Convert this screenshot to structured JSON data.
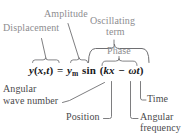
{
  "figure": {
    "kind": "annotated-equation-diagram",
    "colors": {
      "top_label": "#8d8d90",
      "bottom_label": "#4a4a4c",
      "equation": "#17171a",
      "leader_line": "#6f6f72",
      "brace": "#6f6f72",
      "background": "#ffffff"
    }
  },
  "equation": {
    "full_text": "y(x,t) = y_m sin (kx - ωt)",
    "lhs_function": "y",
    "lhs_open": "(",
    "lhs_var_x": "x",
    "lhs_comma": ",",
    "lhs_var_t": "t",
    "lhs_close": ")",
    "equals": "=",
    "amplitude_symbol": "y",
    "amplitude_subscript": "m",
    "sine": "sin",
    "phase_open": "(",
    "wave_number": "k",
    "position": "x",
    "minus": "−",
    "omega": "ω",
    "time": "t",
    "phase_close": ")"
  },
  "labels": {
    "top": [
      {
        "id": "displacement",
        "text": "Displacement"
      },
      {
        "id": "amplitude",
        "text": "Amplitude"
      },
      {
        "id": "oscillating-term-line1",
        "text": "Oscillating"
      },
      {
        "id": "oscillating-term-line2",
        "text": "term"
      },
      {
        "id": "phase",
        "text": "Phase"
      }
    ],
    "bottom": [
      {
        "id": "angular-wave-number-line1",
        "text": "Angular"
      },
      {
        "id": "angular-wave-number-line2",
        "text": "wave number"
      },
      {
        "id": "position",
        "text": "Position"
      },
      {
        "id": "time",
        "text": "Time"
      },
      {
        "id": "angular-frequency-line1",
        "text": "Angular"
      },
      {
        "id": "angular-frequency-line2",
        "text": "frequency"
      }
    ]
  }
}
